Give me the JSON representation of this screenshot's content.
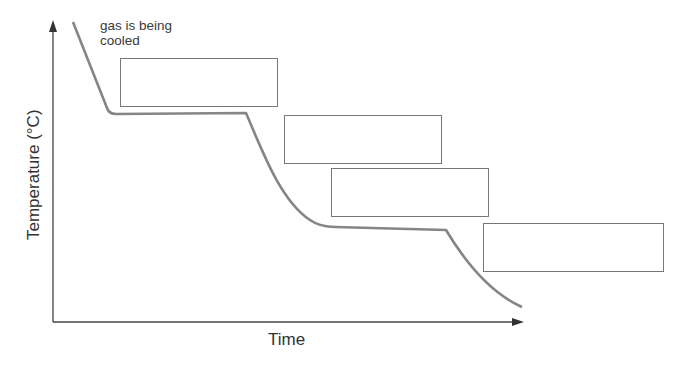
{
  "diagram": {
    "annotation": "gas is being\ncooled",
    "annotation_lines": [
      "gas is being",
      "cooled"
    ],
    "x_axis_label": "Time",
    "y_axis_label": "Temperature (°C)",
    "label_boxes": [
      {
        "id": 1,
        "text": ""
      },
      {
        "id": 2,
        "text": ""
      },
      {
        "id": 3,
        "text": ""
      },
      {
        "id": 4,
        "text": ""
      }
    ],
    "colors": {
      "curve": "#808080",
      "axis": "#444444",
      "box_border": "#777777"
    }
  }
}
